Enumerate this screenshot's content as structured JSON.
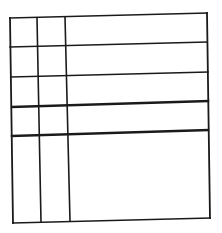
{
  "diagram": {
    "type": "empty-table-grid",
    "rows": 5,
    "columns": 3,
    "line_color": "#1a1a1a",
    "background": "#ffffff",
    "vertical_lines": [
      {
        "name": "left-border",
        "x1": 10,
        "y1": 18,
        "x2": 13,
        "y2": 223,
        "w": 1.8
      },
      {
        "name": "column-divider-1",
        "x1": 37,
        "y1": 18,
        "x2": 41,
        "y2": 222,
        "w": 1.6
      },
      {
        "name": "column-divider-2",
        "x1": 65,
        "y1": 17,
        "x2": 70,
        "y2": 221,
        "w": 1.6
      },
      {
        "name": "right-border",
        "x1": 207,
        "y1": 13,
        "x2": 210,
        "y2": 218,
        "w": 1.8
      }
    ],
    "horizontal_lines": [
      {
        "name": "top-border",
        "x1": 10,
        "y1": 18,
        "x2": 207,
        "y2": 13,
        "w": 1.6
      },
      {
        "name": "row-divider-1",
        "x1": 10,
        "y1": 47,
        "x2": 207,
        "y2": 42,
        "w": 1.6
      },
      {
        "name": "row-divider-2",
        "x1": 11,
        "y1": 77,
        "x2": 208,
        "y2": 72,
        "w": 1.6
      },
      {
        "name": "row-divider-3",
        "x1": 12,
        "y1": 107,
        "x2": 208,
        "y2": 101,
        "w": 2.4
      },
      {
        "name": "row-divider-4",
        "x1": 12,
        "y1": 136,
        "x2": 208,
        "y2": 130,
        "w": 2.4
      },
      {
        "name": "bottom-border",
        "x1": 13,
        "y1": 223,
        "x2": 210,
        "y2": 218,
        "w": 1.6
      }
    ]
  }
}
